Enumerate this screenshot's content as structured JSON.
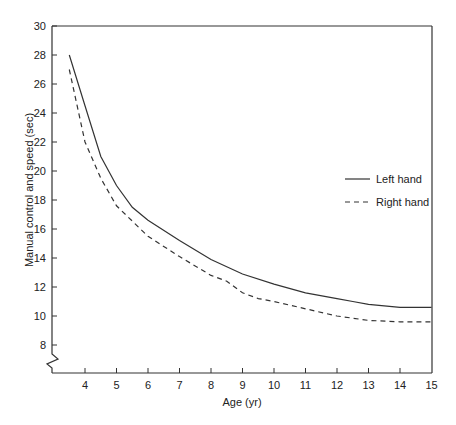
{
  "chart_data": {
    "type": "line",
    "title": "",
    "xlabel": "Age (yr)",
    "ylabel": "Manual control and speed (sec)",
    "xlim": [
      3,
      15
    ],
    "ylim": [
      6.5,
      30
    ],
    "x_ticks": [
      4,
      5,
      6,
      7,
      8,
      9,
      10,
      11,
      12,
      13,
      14,
      15
    ],
    "y_ticks": [
      8,
      10,
      12,
      14,
      16,
      18,
      20,
      22,
      24,
      26,
      28,
      30
    ],
    "y_axis_break": true,
    "grid": false,
    "legend_position": "right-middle",
    "series": [
      {
        "name": "Left hand",
        "style": "solid",
        "x": [
          3.5,
          4,
          4.5,
          5,
          5.5,
          6,
          7,
          8,
          9,
          10,
          11,
          12,
          12.5,
          13,
          14,
          15
        ],
        "values": [
          28,
          24.5,
          21,
          19,
          17.5,
          16.6,
          15.2,
          13.9,
          12.9,
          12.2,
          11.6,
          11.2,
          11.0,
          10.8,
          10.6,
          10.6
        ]
      },
      {
        "name": "Right hand",
        "style": "dashed",
        "x": [
          3.5,
          4,
          4.5,
          5,
          6,
          7,
          8,
          8.5,
          9,
          9.5,
          10,
          11,
          12,
          13,
          14,
          15
        ],
        "values": [
          27,
          22,
          19.5,
          17.6,
          15.5,
          14.1,
          12.8,
          12.4,
          11.6,
          11.2,
          11.0,
          10.5,
          10.0,
          9.7,
          9.6,
          9.6
        ]
      }
    ]
  },
  "legend": {
    "left_hand": "Left hand",
    "right_hand": "Right hand"
  },
  "colors": {
    "line": "#333333",
    "axis": "#333333"
  }
}
